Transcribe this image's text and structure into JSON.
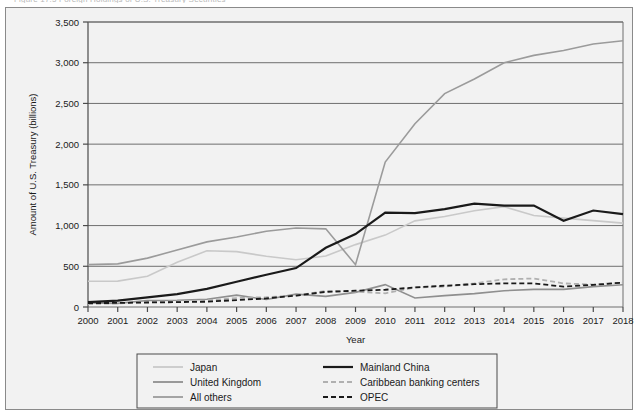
{
  "figure": {
    "background_color": "#f2f2f2",
    "frame_color": "#8a8a8a",
    "top_text_remnant": "Figure 17.5 Foreign Holdings of U.S. Treasury Securities"
  },
  "chart_data": {
    "type": "line",
    "title": "",
    "xlabel": "Year",
    "ylabel": "Amount of U.S. Treasury (billions)",
    "x": [
      2000,
      2001,
      2002,
      2003,
      2004,
      2005,
      2006,
      2007,
      2008,
      2009,
      2010,
      2011,
      2012,
      2013,
      2014,
      2015,
      2016,
      2017,
      2018
    ],
    "xtick_labels": [
      "2000",
      "2001",
      "2002",
      "2003",
      "2004",
      "2005",
      "2006",
      "2007",
      "2008",
      "2009",
      "2010",
      "2011",
      "2012",
      "2013",
      "2014",
      "2015",
      "2016",
      "2017",
      "2018"
    ],
    "ytick_labels": [
      "0",
      "500",
      "1,000",
      "1,500",
      "2,000",
      "2,500",
      "3,000",
      "3,500"
    ],
    "ytick_values": [
      0,
      500,
      1000,
      1500,
      2000,
      2500,
      3000,
      3500
    ],
    "ylim": [
      0,
      3500
    ],
    "xlim": [
      2000,
      2018
    ],
    "grid": "horizontal",
    "legend_position": "bottom",
    "series": [
      {
        "name": "Japan",
        "color": "#c9c9c9",
        "style": "solid",
        "width": 1.6,
        "values": [
          317,
          318,
          378,
          550,
          690,
          680,
          623,
          580,
          626,
          766,
          883,
          1058,
          1111,
          1182,
          1232,
          1123,
          1091,
          1061,
          1030
        ]
      },
      {
        "name": "United Kingdom",
        "color": "#8f8f8f",
        "style": "solid",
        "width": 1.6,
        "values": [
          50,
          45,
          80,
          82,
          95,
          146,
          92,
          158,
          130,
          180,
          275,
          111,
          140,
          164,
          200,
          217,
          217,
          250,
          273
        ]
      },
      {
        "name": "All others",
        "color": "#9b9b9b",
        "style": "solid",
        "width": 1.6,
        "values": [
          520,
          530,
          600,
          700,
          800,
          860,
          930,
          970,
          960,
          520,
          1780,
          2250,
          2620,
          2800,
          3000,
          3090,
          3150,
          3230,
          3270
        ]
      },
      {
        "name": "Mainland China",
        "color": "#1a1a1a",
        "style": "solid",
        "width": 2.2,
        "values": [
          60,
          78,
          118,
          158,
          222,
          310,
          396,
          478,
          727,
          895,
          1160,
          1152,
          1202,
          1270,
          1244,
          1246,
          1058,
          1185,
          1140
        ]
      },
      {
        "name": "Caribbean banking centers",
        "color": "#b0b0b0",
        "style": "dashed",
        "width": 1.8,
        "values": [
          35,
          45,
          60,
          70,
          80,
          110,
          120,
          140,
          197,
          190,
          168,
          240,
          250,
          290,
          340,
          350,
          290,
          275,
          300
        ]
      },
      {
        "name": "OPEC",
        "color": "#1a1a1a",
        "style": "dashed",
        "width": 1.8,
        "values": [
          48,
          50,
          55,
          60,
          65,
          85,
          105,
          140,
          186,
          200,
          212,
          240,
          262,
          280,
          290,
          289,
          251,
          272,
          300
        ]
      }
    ]
  },
  "legend": {
    "entries": [
      {
        "label": "Japan",
        "color": "#c9c9c9",
        "style": "solid"
      },
      {
        "label": "Mainland China",
        "color": "#1a1a1a",
        "style": "solid"
      },
      {
        "label": "United Kingdom",
        "color": "#8f8f8f",
        "style": "solid"
      },
      {
        "label": "Caribbean banking centers",
        "color": "#b0b0b0",
        "style": "dashed"
      },
      {
        "label": "All others",
        "color": "#9b9b9b",
        "style": "solid"
      },
      {
        "label": "OPEC",
        "color": "#1a1a1a",
        "style": "dashed"
      }
    ]
  }
}
